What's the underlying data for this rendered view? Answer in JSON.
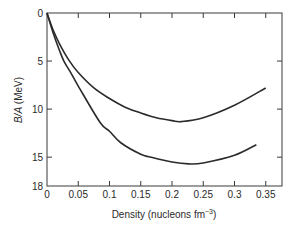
{
  "chart_data": {
    "type": "line",
    "title": "",
    "xlabel": "Density (nucleons fm",
    "xlabel_superscript": "−3",
    "xlabel_suffix": ")",
    "ylabel": "B/A (MeV)",
    "xlim": [
      0,
      0.376
    ],
    "ylim": [
      0,
      18
    ],
    "y_inverted": true,
    "grid": false,
    "legend": null,
    "x_ticks": [
      0,
      0.05,
      0.1,
      0.15,
      0.2,
      0.25,
      0.3,
      0.35
    ],
    "x_tick_labels": [
      "0",
      "0.05",
      "0.1",
      "0.15",
      "0.2",
      "0.25",
      "0.3",
      "0.35"
    ],
    "y_ticks": [
      0,
      5,
      10,
      15,
      18
    ],
    "y_tick_labels": [
      "0",
      "5",
      "10",
      "15",
      "18"
    ],
    "series": [
      {
        "name": "upper curve",
        "x": [
          0,
          0.01,
          0.02,
          0.035,
          0.05,
          0.075,
          0.1,
          0.125,
          0.15,
          0.175,
          0.2,
          0.215,
          0.25,
          0.3,
          0.35
        ],
        "y": [
          0,
          1.8,
          3.2,
          4.9,
          6.2,
          7.8,
          8.9,
          9.8,
          10.4,
          10.9,
          11.2,
          11.3,
          10.9,
          9.6,
          7.8
        ]
      },
      {
        "name": "lower curve",
        "x": [
          0,
          0.01,
          0.02,
          0.027,
          0.037,
          0.05,
          0.085,
          0.1,
          0.118,
          0.15,
          0.166,
          0.2,
          0.227,
          0.25,
          0.3,
          0.335
        ],
        "y": [
          0,
          2.1,
          3.9,
          5.0,
          6.1,
          7.6,
          11.4,
          12.3,
          13.5,
          14.7,
          15.0,
          15.5,
          15.7,
          15.6,
          14.8,
          13.7
        ]
      }
    ]
  },
  "colors": {
    "line": "#2b2b2b",
    "axis": "#3a3a3a",
    "text": "#2a2a2a",
    "background": "#ffffff"
  }
}
